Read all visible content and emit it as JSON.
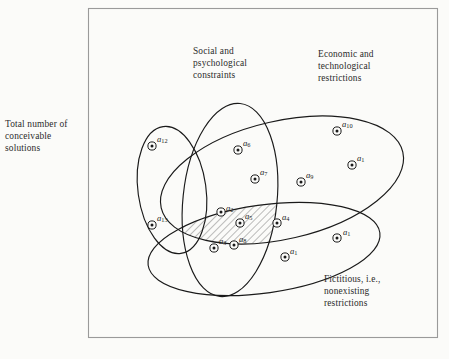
{
  "figure": {
    "background_color": "#fbfbf9",
    "line_color": "#1a1a1a",
    "frame": {
      "x": 88,
      "y": 8,
      "width": 350,
      "height": 330
    }
  },
  "outer_labels": {
    "total": "Total number of\nconceivable\nsolutions",
    "social": "Social and\npsychological\nconstraints",
    "economic": "Economic and\ntechnological\nrestrictions",
    "fictitious": "Fictitious, i.e.,\nnonexisting\nrestrictions"
  },
  "sets": [
    {
      "name": "total-number-of-conceivable-solutions",
      "label": "Total number of conceivable solutions",
      "shape": "rectangle"
    },
    {
      "name": "social-and-psychological-constraints",
      "label": "Social and psychological constraints",
      "shape": "ellipse"
    },
    {
      "name": "economic-and-technological-restrictions",
      "label": "Economic and technological restrictions",
      "shape": "ellipse"
    },
    {
      "name": "fictitious-nonexisting-restrictions",
      "label": "Fictitious, i.e., nonexisting restrictions",
      "shape": "ellipse"
    },
    {
      "name": "left-solution-group",
      "label": "",
      "shape": "ellipse"
    }
  ],
  "hatched_region": {
    "name": "feasible-solution-region",
    "fill": "diagonal-hatch",
    "hatch_angle_deg": 45,
    "contains": [
      "a2",
      "a5",
      "a3",
      "a8"
    ]
  },
  "points": [
    {
      "id": "a12",
      "base": "a",
      "sub": "12",
      "cx": 152,
      "cy": 146,
      "lx": 157,
      "ly": 134
    },
    {
      "id": "a13",
      "base": "a",
      "sub": "13",
      "cx": 152,
      "cy": 225,
      "lx": 157,
      "ly": 213
    },
    {
      "id": "a6",
      "base": "a",
      "sub": "6",
      "cx": 238,
      "cy": 150,
      "lx": 243,
      "ly": 138
    },
    {
      "id": "a7",
      "base": "a",
      "sub": "7",
      "cx": 255,
      "cy": 179,
      "lx": 260,
      "ly": 167
    },
    {
      "id": "a10",
      "base": "a",
      "sub": "10",
      "cx": 337,
      "cy": 131,
      "lx": 342,
      "ly": 119
    },
    {
      "id": "a11",
      "base": "a",
      "sub": "1",
      "cx": 352,
      "cy": 165,
      "lx": 357,
      "ly": 153
    },
    {
      "id": "a9",
      "base": "a",
      "sub": "9",
      "cx": 301,
      "cy": 182,
      "lx": 306,
      "ly": 170
    },
    {
      "id": "a2",
      "base": "a",
      "sub": "2",
      "cx": 221,
      "cy": 212,
      "lx": 226,
      "ly": 203
    },
    {
      "id": "a5",
      "base": "a",
      "sub": "5",
      "cx": 240,
      "cy": 223,
      "lx": 245,
      "ly": 211
    },
    {
      "id": "a4",
      "base": "a",
      "sub": "4",
      "cx": 277,
      "cy": 223,
      "lx": 282,
      "ly": 212
    },
    {
      "id": "a3",
      "base": "a",
      "sub": "3",
      "cx": 214,
      "cy": 248,
      "lx": 219,
      "ly": 236
    },
    {
      "id": "a8",
      "base": "a",
      "sub": "8",
      "cx": 234,
      "cy": 245,
      "lx": 239,
      "ly": 234
    },
    {
      "id": "a1r",
      "base": "a",
      "sub": "1",
      "cx": 337,
      "cy": 238,
      "lx": 343,
      "ly": 227
    },
    {
      "id": "a1b",
      "base": "a",
      "sub": "1",
      "cx": 285,
      "cy": 257,
      "lx": 290,
      "ly": 246
    }
  ]
}
